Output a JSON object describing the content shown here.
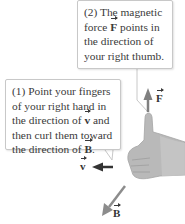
{
  "callouts": {
    "force": {
      "pre": "(2) The magnetic force ",
      "vec": "F",
      "post": " points in the direction of your right thumb."
    },
    "fingers": {
      "pre": "(1) Point your fingers of your right hand in the direction of ",
      "vec1": "v",
      "mid": " and then curl them toward the direction of ",
      "vec2": "B",
      "post": "."
    }
  },
  "vectors": {
    "F": "F",
    "v": "v",
    "B": "B"
  },
  "colors": {
    "hand": "#b8b8b8",
    "arrow_F": "#808080",
    "arrow_v": "#333333",
    "arrow_B": "#8c8c8c",
    "callout_border": "#c8c8c8"
  }
}
